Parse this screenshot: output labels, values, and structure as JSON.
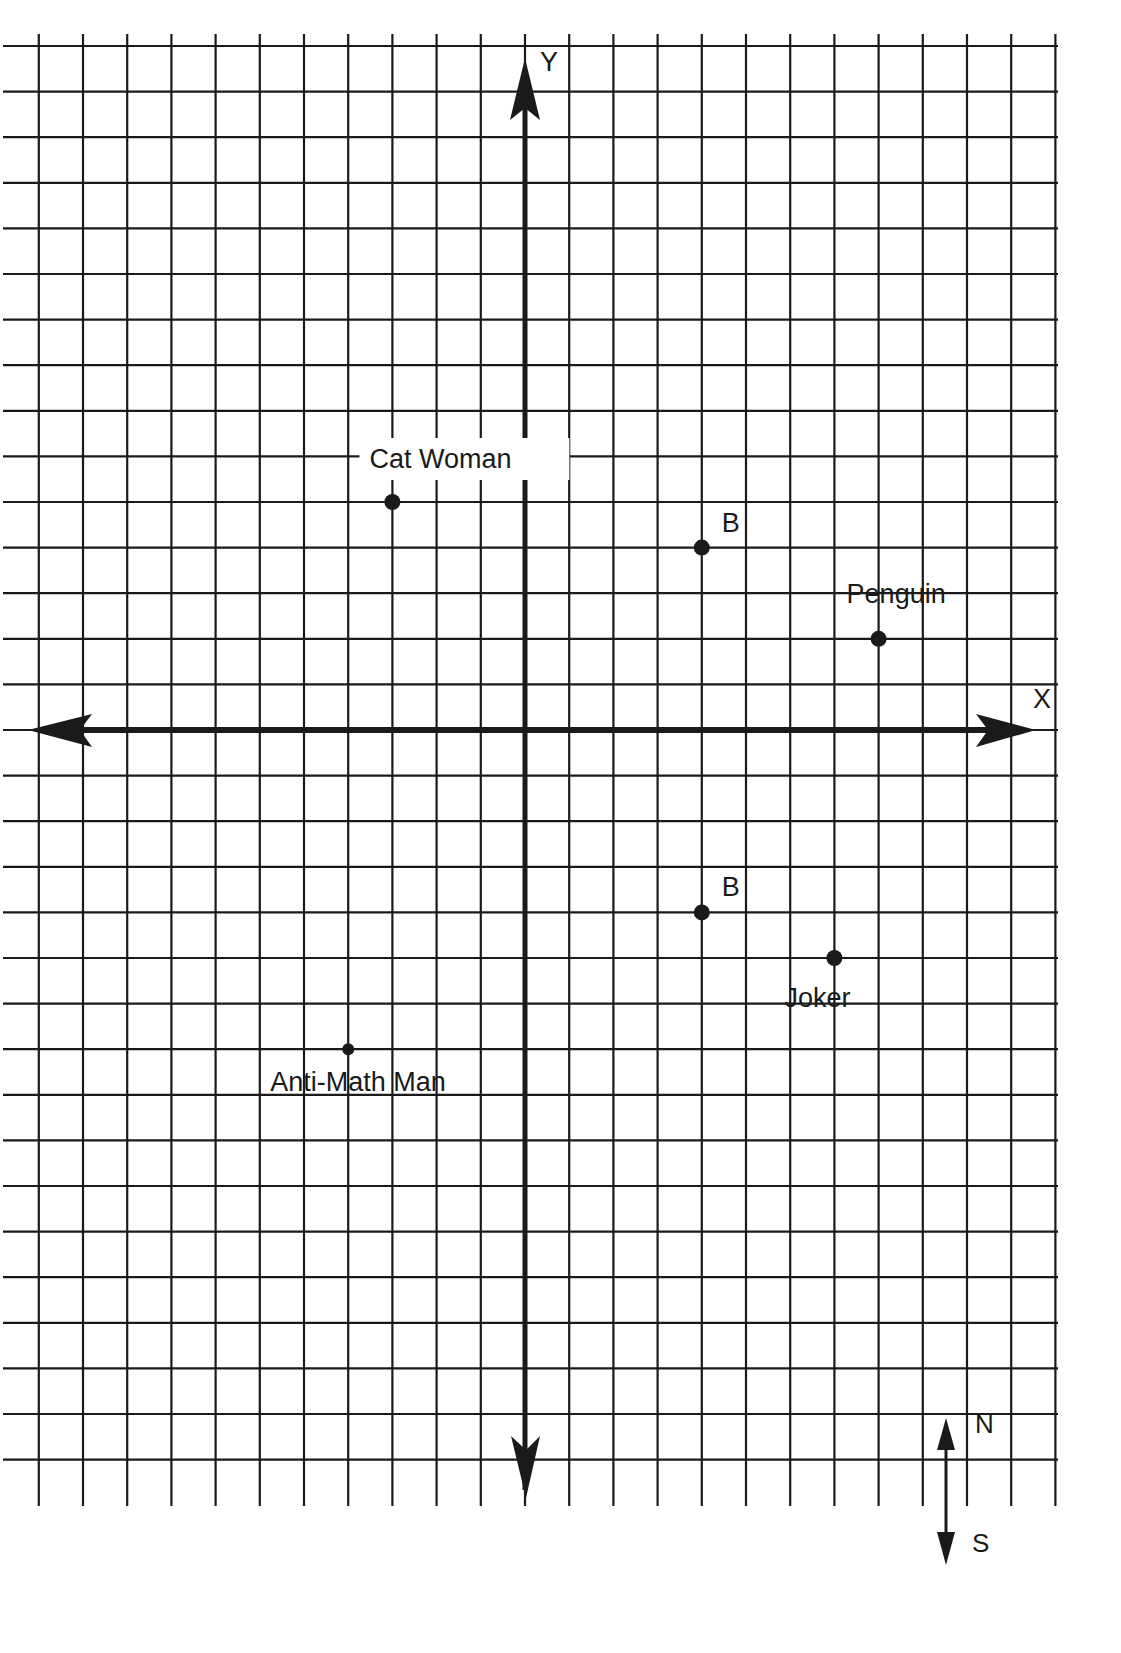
{
  "chart_data": {
    "type": "scatter",
    "title": "",
    "xlabel": "X",
    "ylabel": "Y",
    "grid": true,
    "axis_range": {
      "x": [
        -11,
        11
      ],
      "y": [
        -17,
        15
      ]
    },
    "points": [
      {
        "label": "Cat Woman",
        "x": -3,
        "y": 5
      },
      {
        "label": "B",
        "x": 4,
        "y": 4
      },
      {
        "label": "Penguin",
        "x": 8,
        "y": 2
      },
      {
        "label": "B",
        "x": 4,
        "y": -4
      },
      {
        "label": "Joker",
        "x": 7,
        "y": -5
      },
      {
        "label": "Anti-Math Man",
        "x": -4,
        "y": -7
      }
    ],
    "compass": {
      "north": "N",
      "south": "S"
    }
  },
  "colors": {
    "ink": "#1a1a1a",
    "paper": "#ffffff"
  }
}
